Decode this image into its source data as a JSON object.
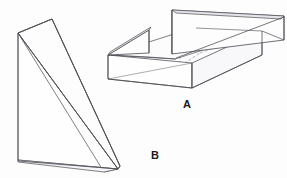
{
  "drawing": {
    "title": "Isometric technical drawing of two machined parts",
    "background_color": "#fdfdfd",
    "line_color": "#4a4a52",
    "hidden_line_color": "#8a8a92",
    "face_fill": "#fefefe",
    "shade_fill": "#f3f3f5",
    "stroke_width": 0.7,
    "hidden_dash": "3,2"
  },
  "labels": {
    "part_a": "A",
    "part_b": "B"
  },
  "parts": [
    {
      "id": "A",
      "name": "open-top-box-with-notched-walls",
      "label": "A",
      "description": "Rectangular tray shown in isometric view with a raised back wall, a triangular left side wall, and a notch gap separating them; hidden interior pocket edges drawn as dashed lines.",
      "visible_faces": [
        "front-face",
        "right-face",
        "top-rim",
        "back-inner-wall",
        "left-triangular-wall"
      ],
      "hidden_edges": true
    },
    {
      "id": "B",
      "name": "triangular-wedge-prism",
      "label": "B",
      "description": "Right-triangular wedge prism shown in isometric view with a large inclined top face sloping from the upper-left apex down to the lower-right edge.",
      "visible_faces": [
        "inclined-top-face",
        "left-vertical-face",
        "bottom-edge"
      ],
      "hidden_edges": false
    }
  ],
  "geometry": {
    "part_a": {
      "front_face": "108,55 108,79 192,87 192,62",
      "right_face": "192,62 192,87 260,52 260,30",
      "top_rim_outline": "108,55 192,62 260,30 177,25",
      "back_wall_top": "172,8 284,14 284,39 260,30",
      "left_wall_triangle": "108,55 148,30 148,52",
      "notch_gap": "148,30 172,33",
      "hidden_pocket": "133,60 180,66 196,52 150,47"
    },
    "part_b": {
      "outline": "18,33 52,19 120,168 18,160",
      "inclined_face": "18,33 52,19 120,168 104,172",
      "left_face": "18,33 18,160 104,172"
    }
  }
}
